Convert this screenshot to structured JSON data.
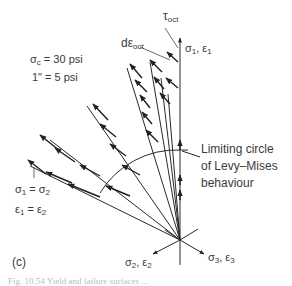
{
  "figure": {
    "panel_label": "(c)",
    "params": {
      "sigma_c": "σc = 30 psi",
      "sigma_c_sym": "σ",
      "sigma_c_sub": "c",
      "sigma_c_val": "= 30 psi",
      "inch_sym": "1\"",
      "inch_val": "= 5 psi"
    },
    "labels": {
      "tau_oct": "τ",
      "tau_oct_sub": "oct",
      "d_eps_oct": "dε",
      "d_eps_oct_sub": "oct",
      "axis1": "σ",
      "axis1_sub": "1",
      "axis1_eps": ", ε",
      "axis1_eps_sub": "1",
      "axis2": "σ",
      "axis2_sub": "2",
      "axis2_eps": ", ε",
      "axis2_eps_sub": "2",
      "axis3": "σ",
      "axis3_sub": "3",
      "axis3_eps": ", ε",
      "axis3_eps_sub": "3",
      "eq1_l": "σ",
      "eq1_l_sub": "1",
      "eq1_r": "= σ",
      "eq1_r_sub": "2",
      "eq2_l": "ε",
      "eq2_l_sub": "1",
      "eq2_r": "= ε",
      "eq2_r_sub": "2",
      "limit_1": "Limiting  circle",
      "limit_2": "of  Levy–Mises",
      "limit_3": "behaviour"
    },
    "caption_partial": "Fig. 10.54  Yield and failure surfaces ..."
  }
}
